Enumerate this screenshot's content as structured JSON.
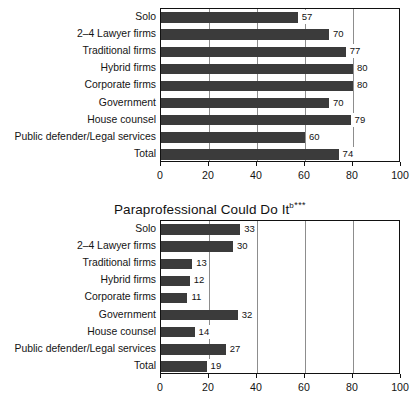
{
  "page": {
    "background": "#ffffff",
    "bar_color": "#3b3b3b",
    "axis_color": "#111111",
    "grid_color": "#8d8d8d"
  },
  "charts": [
    {
      "id": "lawyer-could-do-it",
      "title_text": "",
      "title_sup": "",
      "title_stars": "",
      "chart_data": {
        "type": "bar",
        "orientation": "horizontal",
        "title": "",
        "xlabel": "",
        "ylabel": "",
        "xlim": [
          0,
          100
        ],
        "ticks": [
          0,
          20,
          40,
          60,
          80,
          100
        ],
        "gridlines": [
          20,
          40,
          60,
          80
        ],
        "grid": true,
        "legend": "none",
        "categories": [
          "Solo",
          "2–4 Lawyer firms",
          "Traditional firms",
          "Hybrid firms",
          "Corporate firms",
          "Government",
          "House counsel",
          "Public defender/Legal services",
          "Total"
        ],
        "values": [
          57,
          70,
          77,
          80,
          80,
          70,
          79,
          60,
          74
        ]
      }
    },
    {
      "id": "paraprofessional-could-do-it",
      "title_text": "Paraprofessional Could Do It",
      "title_sup": "b",
      "title_stars": "***",
      "chart_data": {
        "type": "bar",
        "orientation": "horizontal",
        "title": "Paraprofessional Could Do It b ***",
        "xlabel": "",
        "ylabel": "",
        "xlim": [
          0,
          100
        ],
        "ticks": [
          0,
          20,
          40,
          60,
          80,
          100
        ],
        "gridlines": [
          20,
          40,
          60,
          80
        ],
        "grid": true,
        "legend": "none",
        "categories": [
          "Solo",
          "2–4 Lawyer firms",
          "Traditional firms",
          "Hybrid firms",
          "Corporate firms",
          "Government",
          "House counsel",
          "Public defender/Legal services",
          "Total"
        ],
        "values": [
          33,
          30,
          13,
          12,
          11,
          32,
          14,
          27,
          19
        ]
      }
    }
  ]
}
